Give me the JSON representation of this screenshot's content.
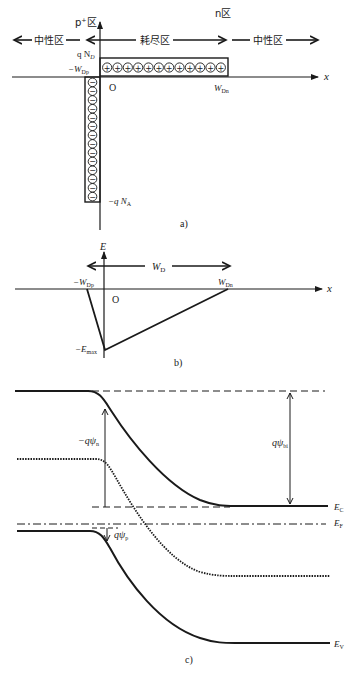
{
  "panel_a": {
    "caption": "a)",
    "region_p_label": "p⁺区",
    "region_n_label": "n区",
    "neutral_left_label": "中性区",
    "depletion_label": "耗尽区",
    "neutral_right_label": "中性区",
    "qnd_label": "q N",
    "qnd_sub": "D",
    "wdp_label": "−W",
    "wdp_sub": "Dp",
    "wdn_label": "W",
    "wdn_sub": "Dn",
    "origin_label": "O",
    "x_axis_label": "x",
    "qna_label": "−q N",
    "qna_sub": "A",
    "positive_charges": 12,
    "negative_charges": 14,
    "plus_glyph": "+",
    "minus_glyph": "−"
  },
  "panel_b": {
    "caption": "b)",
    "y_axis_label": "E",
    "wd_label": "W",
    "wd_sub": "D",
    "wdp_label": "−W",
    "wdp_sub": "Dp",
    "wdn_label": "W",
    "wdn_sub": "Dn",
    "origin_label": "O",
    "x_axis_label": "x",
    "emax_label": "−E",
    "emax_sub": "max"
  },
  "panel_c": {
    "caption": "c)",
    "psi_n_label": "−qψ",
    "psi_n_sub": "n",
    "psi_bi_label": "qψ",
    "psi_bi_sub": "bi",
    "psi_p_label": "qψ",
    "psi_p_sub": "p",
    "ec_label": "E",
    "ec_sub": "C",
    "ef_label": "E",
    "ef_sub": "F",
    "ev_label": "E",
    "ev_sub": "V"
  },
  "colors": {
    "ink": "#1a1a1a",
    "background": "#ffffff"
  }
}
